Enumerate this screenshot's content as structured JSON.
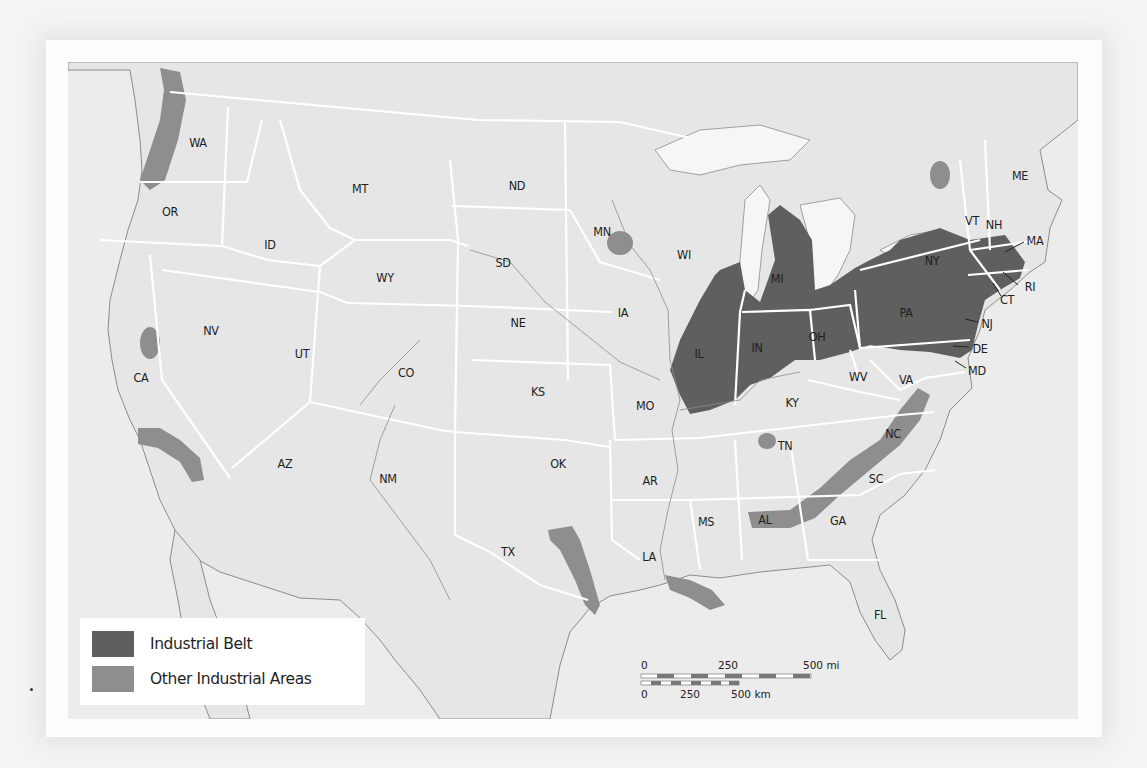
{
  "map": {
    "title": "Industrial Regions of the United States",
    "colors": {
      "land": "#e9e9e9",
      "ocean": "#ececec",
      "border": "#ffffff",
      "coast": "#8a8a8a",
      "industrial_belt": "#5f5f5f",
      "other_industrial": "#8e8e8e",
      "lakes": "#f6f6f6"
    },
    "states": [
      {
        "abbr": "WA",
        "x": 198,
        "y": 142
      },
      {
        "abbr": "OR",
        "x": 170,
        "y": 211
      },
      {
        "abbr": "CA",
        "x": 141,
        "y": 377
      },
      {
        "abbr": "NV",
        "x": 211,
        "y": 330
      },
      {
        "abbr": "ID",
        "x": 270,
        "y": 244
      },
      {
        "abbr": "MT",
        "x": 360,
        "y": 188
      },
      {
        "abbr": "WY",
        "x": 385,
        "y": 277
      },
      {
        "abbr": "UT",
        "x": 302,
        "y": 353
      },
      {
        "abbr": "AZ",
        "x": 285,
        "y": 463
      },
      {
        "abbr": "CO",
        "x": 406,
        "y": 372
      },
      {
        "abbr": "NM",
        "x": 388,
        "y": 478
      },
      {
        "abbr": "ND",
        "x": 517,
        "y": 185
      },
      {
        "abbr": "SD",
        "x": 503,
        "y": 262
      },
      {
        "abbr": "NE",
        "x": 518,
        "y": 322
      },
      {
        "abbr": "KS",
        "x": 538,
        "y": 391
      },
      {
        "abbr": "OK",
        "x": 558,
        "y": 463
      },
      {
        "abbr": "TX",
        "x": 508,
        "y": 551
      },
      {
        "abbr": "MN",
        "x": 602,
        "y": 231
      },
      {
        "abbr": "IA",
        "x": 623,
        "y": 312
      },
      {
        "abbr": "MO",
        "x": 645,
        "y": 405
      },
      {
        "abbr": "AR",
        "x": 650,
        "y": 480
      },
      {
        "abbr": "LA",
        "x": 649,
        "y": 556
      },
      {
        "abbr": "WI",
        "x": 684,
        "y": 254
      },
      {
        "abbr": "IL",
        "x": 699,
        "y": 353
      },
      {
        "abbr": "MI",
        "x": 777,
        "y": 278
      },
      {
        "abbr": "IN",
        "x": 757,
        "y": 347
      },
      {
        "abbr": "OH",
        "x": 817,
        "y": 336
      },
      {
        "abbr": "KY",
        "x": 792,
        "y": 402
      },
      {
        "abbr": "TN",
        "x": 785,
        "y": 445
      },
      {
        "abbr": "MS",
        "x": 706,
        "y": 521
      },
      {
        "abbr": "AL",
        "x": 765,
        "y": 519
      },
      {
        "abbr": "GA",
        "x": 838,
        "y": 520
      },
      {
        "abbr": "FL",
        "x": 880,
        "y": 614
      },
      {
        "abbr": "SC",
        "x": 876,
        "y": 478
      },
      {
        "abbr": "NC",
        "x": 893,
        "y": 433
      },
      {
        "abbr": "VA",
        "x": 906,
        "y": 379
      },
      {
        "abbr": "WV",
        "x": 858,
        "y": 376
      },
      {
        "abbr": "PA",
        "x": 906,
        "y": 312
      },
      {
        "abbr": "NY",
        "x": 932,
        "y": 260
      },
      {
        "abbr": "ME",
        "x": 1020,
        "y": 175
      },
      {
        "abbr": "VT",
        "x": 972,
        "y": 220
      },
      {
        "abbr": "NH",
        "x": 994,
        "y": 224
      },
      {
        "abbr": "MA",
        "x": 1035,
        "y": 240
      },
      {
        "abbr": "RI",
        "x": 1030,
        "y": 286
      },
      {
        "abbr": "CT",
        "x": 1007,
        "y": 299
      },
      {
        "abbr": "NJ",
        "x": 987,
        "y": 323
      },
      {
        "abbr": "DE",
        "x": 980,
        "y": 348
      },
      {
        "abbr": "MD",
        "x": 977,
        "y": 370
      }
    ]
  },
  "legend": {
    "items": [
      {
        "label": "Industrial Belt",
        "color": "#5f5f5f"
      },
      {
        "label": "Other Industrial Areas",
        "color": "#8e8e8e"
      }
    ]
  },
  "scale_bar": {
    "miles": {
      "ticks": [
        "0",
        "250",
        "500 mi"
      ]
    },
    "km": {
      "ticks": [
        "0",
        "250",
        "500 km"
      ]
    }
  }
}
